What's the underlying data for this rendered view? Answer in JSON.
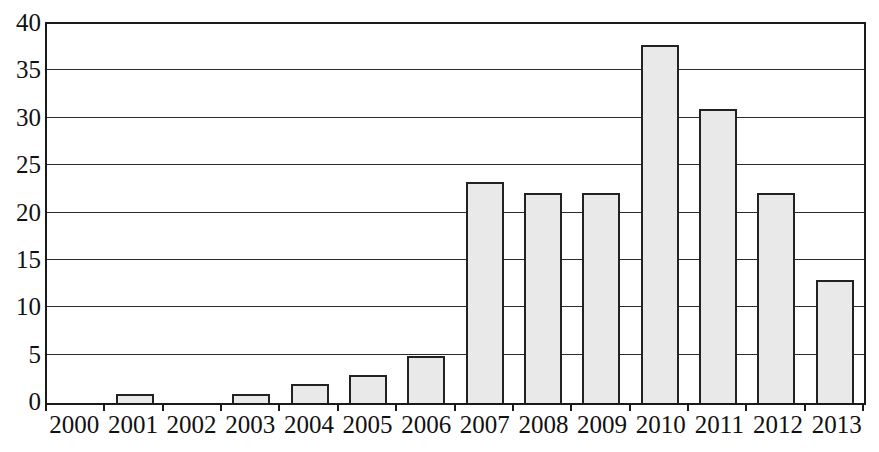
{
  "chart_data": {
    "type": "bar",
    "title": "",
    "subtitle": "",
    "xlabel": "",
    "ylabel": "",
    "categories": [
      "2000",
      "2001",
      "2002",
      "2003",
      "2004",
      "2005",
      "2006",
      "2007",
      "2008",
      "2009",
      "2010",
      "2011",
      "2012",
      "2013"
    ],
    "values": [
      0,
      1,
      0,
      1,
      2,
      3,
      5,
      23.4,
      22.3,
      22.3,
      38,
      31.2,
      22.3,
      13
    ],
    "series": [
      {
        "name": "",
        "values": [
          0,
          1,
          0,
          1,
          2,
          3,
          5,
          23.4,
          22.3,
          22.3,
          38,
          31.2,
          22.3,
          13
        ]
      }
    ],
    "ylim": [
      0,
      40
    ],
    "y_ticks": [
      0,
      5,
      10,
      15,
      20,
      25,
      30,
      35,
      40
    ],
    "y_tick_labels": [
      "0",
      "5",
      "10",
      "15",
      "20",
      "25",
      "30",
      "35",
      "40"
    ],
    "grid": true,
    "grid_axis": "y",
    "legend": false,
    "legend_position": "none",
    "bar_fill_color": "#e9e9e9",
    "bar_border_color": "#222222",
    "axis_color": "#1a1a1a",
    "gridline_color": "#2b2b2b",
    "background_color": "#ffffff",
    "text_color": "#111111"
  }
}
